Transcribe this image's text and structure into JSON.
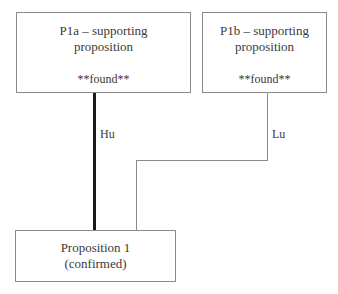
{
  "nodes": {
    "p1a": {
      "title": "P1a – supporting proposition",
      "line1": "P1a – supporting",
      "line2": "proposition",
      "status": "**found**"
    },
    "p1b": {
      "title": "P1b – supporting proposition",
      "line1": "P1b – supporting",
      "line2": "proposition",
      "status": "**found**"
    },
    "prop1": {
      "line1": "Proposition 1",
      "line2": "(confirmed)"
    }
  },
  "edges": {
    "p1a_to_prop1": {
      "label": "Hu",
      "style": "thick",
      "color": "#1a1a1a"
    },
    "p1b_to_prop1": {
      "label": "Lu",
      "style": "thin",
      "color": "#8a8a8a"
    }
  }
}
